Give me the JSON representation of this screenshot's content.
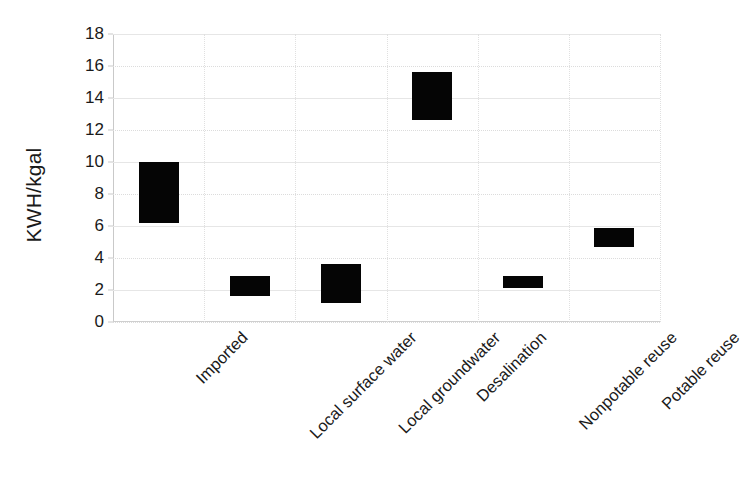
{
  "chart_data": {
    "type": "bar",
    "bar_style": "floating-range",
    "title": "",
    "subtitle": "",
    "xlabel": "",
    "ylabel": "KWH/kgal",
    "categories": [
      "Imported",
      "Local surface water",
      "Local groundwater",
      "Desalination",
      "Nonpotable reuse",
      "Potable reuse"
    ],
    "series": [
      {
        "name": "Energy intensity range",
        "low": [
          6.2,
          1.65,
          1.2,
          12.6,
          2.1,
          4.7
        ],
        "high": [
          10.0,
          2.9,
          3.6,
          15.6,
          2.9,
          5.9
        ]
      }
    ],
    "ylim": [
      0,
      18
    ],
    "yticks": [
      0,
      2,
      4,
      6,
      8,
      10,
      12,
      14,
      16,
      18
    ],
    "ytick_labels": [
      "0",
      "2",
      "4",
      "6",
      "8",
      "10",
      "12",
      "14",
      "16",
      "18"
    ],
    "grid": true,
    "grid_axis": "both",
    "legend": false,
    "legend_position": "none",
    "bar_color": "#050505",
    "grid_color": "#dcdcdc",
    "axis_color": "#c9c9c9",
    "text_color": "#1a1a1a",
    "xtick_rotation": -45
  }
}
